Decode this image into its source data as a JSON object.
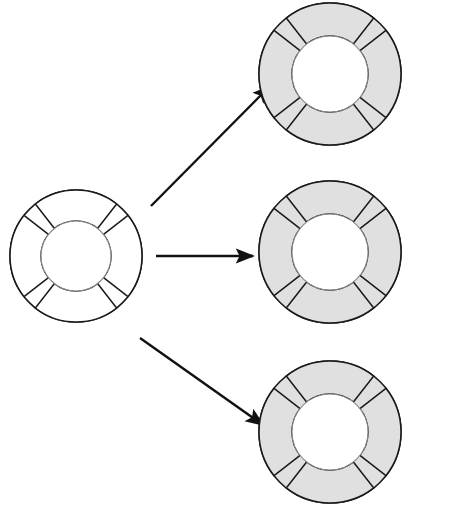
{
  "diagram": {
    "colors": {
      "ring_fill_object": "#e0e0e0",
      "ring_fill_class": "#ffffff",
      "core_fill": "#ffffff",
      "stroke": "#1a1a1a",
      "core_stroke": "#8a8a8a",
      "arrow": "#111111",
      "background": "#ffffff"
    },
    "segment_label": "Method",
    "core_label": "re, im",
    "nodes": [
      {
        "id": "class-node",
        "kind": "class",
        "caption": "class complex_ob",
        "core": "re, im",
        "segments": [
          "Method",
          "Method",
          "Method",
          "Method"
        ],
        "shaded": false,
        "cx": 76,
        "cy": 256,
        "r_outer": 66,
        "r_inner": 35
      },
      {
        "id": "object-a",
        "kind": "object",
        "caption": "Object a",
        "core": "re, im",
        "segments": [
          "Method",
          "Method",
          "Method",
          "Method"
        ],
        "shaded": true,
        "cx": 330,
        "cy": 74,
        "r_outer": 71,
        "r_inner": 38
      },
      {
        "id": "object-b",
        "kind": "object",
        "caption": "Object b",
        "core": "re, im",
        "segments": [
          "Method",
          "Method",
          "Method",
          "Method"
        ],
        "shaded": true,
        "cx": 330,
        "cy": 252,
        "r_outer": 71,
        "r_inner": 38
      },
      {
        "id": "object-c",
        "kind": "object",
        "caption": "Object c",
        "core": "re, im",
        "segments": [
          "Method",
          "Method",
          "Method",
          "Method"
        ],
        "shaded": true,
        "cx": 330,
        "cy": 432,
        "r_outer": 71,
        "r_inner": 38
      }
    ],
    "arrows": [
      {
        "id": "arrow-to-object-a",
        "label": "",
        "x1": 151,
        "y1": 206,
        "x2": 270,
        "y2": 86
      },
      {
        "id": "arrow-to-object-b",
        "label": "",
        "x1": 156,
        "y1": 256,
        "x2": 253,
        "y2": 256
      },
      {
        "id": "arrow-to-object-c",
        "label": "",
        "x1": 140,
        "y1": 338,
        "x2": 263,
        "y2": 425
      }
    ]
  }
}
